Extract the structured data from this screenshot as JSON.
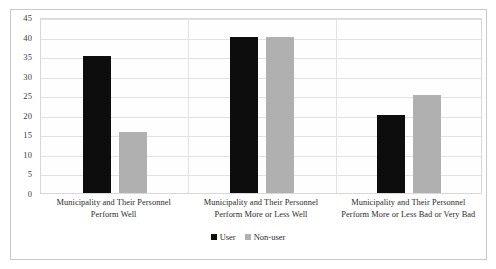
{
  "chart_data": {
    "type": "bar",
    "title": "",
    "subtitle": "",
    "xlabel": "",
    "ylabel": "",
    "ylim": [
      0,
      45
    ],
    "ytick_step": 5,
    "yticks": [
      "45",
      "40",
      "35",
      "30",
      "25",
      "20",
      "15",
      "10",
      "5",
      "0"
    ],
    "grid": true,
    "legend_position": "bottom-center",
    "categories": [
      "Municipality and Their Personnel Perform Well",
      "Municipality and Their Personnel Perform More or Less Well",
      "Municipality and Their Personnel Perform More or Less Bad or Very Bad"
    ],
    "category_lines": [
      [
        "Municipality and Their Personnel",
        "Perform Well"
      ],
      [
        "Municipality and Their Personnel",
        "Perform More or Less Well"
      ],
      [
        "Municipality and Their Personnel",
        "Perform More or Less Bad or Very Bad"
      ]
    ],
    "series": [
      {
        "name": "User",
        "color": "#0d0d0d",
        "values": [
          35,
          40,
          20
        ]
      },
      {
        "name": "Non-user",
        "color": "#b0b0b0",
        "values": [
          15.5,
          40,
          25
        ]
      }
    ]
  },
  "legend": {
    "items": [
      {
        "label": "User",
        "color": "#0d0d0d"
      },
      {
        "label": "Non-user",
        "color": "#b0b0b0"
      }
    ]
  },
  "colors": {
    "user_bar": "#0d0d0d",
    "nonuser_bar": "#b0b0b0",
    "gridline": "#e2e2e2",
    "plot_border": "#d8d8d8",
    "outer_border": "#c9c9c9",
    "background": "#ffffff",
    "text": "#2b2b2b"
  }
}
